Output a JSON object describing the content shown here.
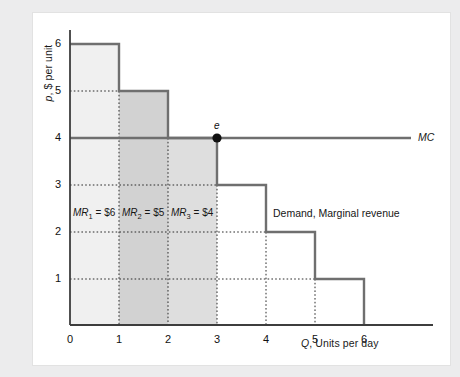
{
  "figure": {
    "background": "#ececed",
    "panel_background": "#ffffff"
  },
  "axes": {
    "y_title_html": "<i>p</i>, $ per unit",
    "y_title_text": "p, $ per unit",
    "x_title_html": "<i>Q</i>, Units per day",
    "x_title_text": "Q, Units per day",
    "x_ticks": [
      "0",
      "1",
      "2",
      "3",
      "4",
      "5",
      "6"
    ],
    "y_ticks": [
      "1",
      "2",
      "3",
      "4",
      "5",
      "6"
    ]
  },
  "labels": {
    "mc": "MC",
    "demand": "Demand, Marginal revenue",
    "point_e": "e",
    "mr1_html": "<i>MR</i><sub>1</sub> = $6",
    "mr2_html": "<i>MR</i><sub>2</sub> = $5",
    "mr3_html": "<i>MR</i><sub>3</sub> = $4",
    "mr1_text": "MR1 = $6",
    "mr2_text": "MR2 = $5",
    "mr3_text": "MR3 = $4"
  },
  "colors": {
    "curve": "#6f6f6f",
    "axis": "#3d3d3d",
    "grid_dotted": "#2b2b2b",
    "shade_light": "#f0f0f0",
    "shade_dark": "#d2d2d2",
    "shade_medium": "#dedede",
    "point": "#111111"
  },
  "chart_data": {
    "type": "bar",
    "title": "",
    "subtitle": "",
    "xlabel": "Q, Units per day",
    "ylabel": "p, $ per unit",
    "xlim": [
      0,
      6.6
    ],
    "ylim": [
      0,
      6.6
    ],
    "xticks": [
      0,
      1,
      2,
      3,
      4,
      5,
      6
    ],
    "yticks": [
      1,
      2,
      3,
      4,
      5,
      6
    ],
    "grid": "dotted-guides-only",
    "legend": "inline-labels",
    "categories": [
      "1st unit",
      "2nd unit",
      "3rd unit",
      "4th unit",
      "5th unit",
      "6th unit"
    ],
    "series": [
      {
        "name": "Demand, Marginal revenue",
        "type": "step",
        "x_intervals": [
          [
            0,
            1
          ],
          [
            1,
            2
          ],
          [
            2,
            3
          ],
          [
            3,
            4
          ],
          [
            4,
            5
          ],
          [
            5,
            6
          ]
        ],
        "values": [
          6,
          5,
          4,
          3,
          2,
          1
        ]
      },
      {
        "name": "MC",
        "type": "line",
        "x": [
          0,
          6.6
        ],
        "values": [
          4,
          4
        ]
      }
    ],
    "shaded_regions": [
      {
        "label": "MR1 = $6",
        "x_interval": [
          0,
          1
        ],
        "y_top": 6,
        "shade": "#f0f0f0"
      },
      {
        "label": "MR2 = $5",
        "x_interval": [
          1,
          2
        ],
        "y_top": 5,
        "shade": "#d2d2d2"
      },
      {
        "label": "MR3 = $4",
        "x_interval": [
          2,
          3
        ],
        "y_top": 4,
        "shade": "#dedede"
      }
    ],
    "annotations": [
      {
        "text": "e",
        "x": 3,
        "y": 4,
        "marker": "filled-circle"
      },
      {
        "text": "MC",
        "x": 6.7,
        "y": 4
      },
      {
        "text": "Demand, Marginal revenue",
        "x": 4.05,
        "y": 2.5
      },
      {
        "text": "MR1 = $6",
        "x": 0.5,
        "y": 2.5
      },
      {
        "text": "MR2 = $5",
        "x": 1.5,
        "y": 2.5
      },
      {
        "text": "MR3 = $4",
        "x": 2.5,
        "y": 2.5
      }
    ]
  }
}
